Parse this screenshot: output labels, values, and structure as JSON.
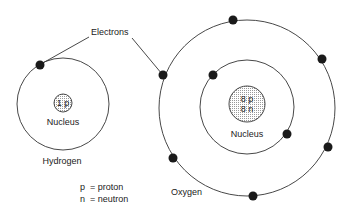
{
  "diagram": {
    "callout_label": "Electrons",
    "hydrogen": {
      "name": "Hydrogen",
      "nucleus_label": "Nucleus",
      "nucleus_content": [
        "1 p"
      ],
      "shells": [
        {
          "electrons": 1
        }
      ]
    },
    "oxygen": {
      "name": "Oxygen",
      "nucleus_label": "Nucleus",
      "nucleus_content": [
        "8 p",
        "8 n"
      ],
      "shells": [
        {
          "electrons": 2
        },
        {
          "electrons": 6
        }
      ]
    },
    "legend": [
      {
        "symbol": "p",
        "meaning": "= proton"
      },
      {
        "symbol": "n",
        "meaning": "= neutron"
      }
    ],
    "colors": {
      "line": "#333333",
      "electron": "#1a1a1a",
      "nucleus_fill": "#d9d9d9"
    }
  }
}
